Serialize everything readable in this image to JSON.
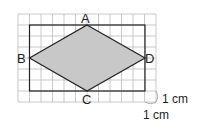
{
  "diagram": {
    "grid": {
      "cols": 12,
      "rows": 8,
      "x0": 18,
      "y0": 14,
      "cell_w": 11.5,
      "cell_h": 11,
      "color": "#bbbbbb"
    },
    "rectangle": {
      "x": 29.5,
      "y": 25,
      "w": 115.5,
      "h": 66,
      "stroke": "#222222"
    },
    "rhombus": {
      "fill": "#c8c8c8",
      "stroke": "#222222",
      "vertices": [
        {
          "label": "A",
          "x": 87,
          "y": 25
        },
        {
          "label": "D",
          "x": 145,
          "y": 58
        },
        {
          "label": "C",
          "x": 87,
          "y": 91
        },
        {
          "label": "B",
          "x": 29.5,
          "y": 58
        }
      ]
    },
    "labels": {
      "A": "A",
      "B": "B",
      "C": "C",
      "D": "D"
    },
    "scale": {
      "horizontal": "1 cm",
      "vertical": "1 cm"
    }
  }
}
